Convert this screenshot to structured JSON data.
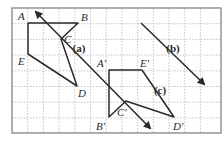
{
  "figure": {
    "frame": {
      "x1": 12,
      "y1": 8,
      "x2": 221,
      "y2": 133
    },
    "grid": {
      "x0": 12,
      "y0": 8,
      "step": 15.7,
      "cols": 13,
      "rows": 8,
      "color": "#b5b5b5",
      "style": "dotted"
    },
    "stroke_color": "#2a2a2a",
    "polygons": [
      {
        "name": "original",
        "points": [
          [
            28,
            23
          ],
          [
            78,
            23
          ],
          [
            61,
            39
          ],
          [
            77,
            86
          ],
          [
            28,
            54
          ]
        ]
      },
      {
        "name": "image",
        "points": [
          [
            109,
            70
          ],
          [
            142,
            70
          ],
          [
            174,
            117
          ],
          [
            126,
            101
          ],
          [
            109,
            117
          ]
        ]
      }
    ],
    "lines": [
      {
        "name": "reflection-line-a",
        "from": [
          36,
          12
        ],
        "to": [
          150,
          128
        ],
        "arrow_start": true,
        "arrow_end": true
      },
      {
        "name": "line-b",
        "from": [
          141,
          23
        ],
        "to": [
          204,
          84
        ],
        "arrow_start": false,
        "arrow_end": true
      }
    ],
    "vertex_labels": [
      {
        "text": "A",
        "x": 18,
        "y": 20
      },
      {
        "text": "B",
        "x": 81,
        "y": 21
      },
      {
        "text": "C",
        "x": 64,
        "y": 43
      },
      {
        "text": "D",
        "x": 78,
        "y": 97
      },
      {
        "text": "E",
        "x": 18,
        "y": 65
      },
      {
        "text": "A′",
        "x": 97,
        "y": 67
      },
      {
        "text": "E′",
        "x": 140,
        "y": 67
      },
      {
        "text": "D′",
        "x": 173,
        "y": 130
      },
      {
        "text": "C′",
        "x": 117,
        "y": 116
      },
      {
        "text": "B′",
        "x": 96,
        "y": 130
      }
    ],
    "part_labels": [
      {
        "text": "(a)",
        "x": 79,
        "y": 52
      },
      {
        "text": "(b)",
        "x": 173,
        "y": 52
      },
      {
        "text": "(c)",
        "x": 160,
        "y": 94
      }
    ]
  }
}
